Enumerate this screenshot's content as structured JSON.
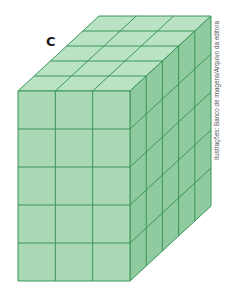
{
  "figure": {
    "label": "C",
    "credit": "Ilustrações: Banco de imagens/Arquivo da editora",
    "solid": {
      "shape": "rectangular prism made of unit cubes",
      "width_cubes": 3,
      "height_cubes": 5,
      "depth_cubes": 5
    },
    "colors": {
      "front_face": "#a9d9b5",
      "top_face": "#b9e3c4",
      "side_face": "#8fcb9f",
      "grid_lines": "#3a9658"
    }
  }
}
